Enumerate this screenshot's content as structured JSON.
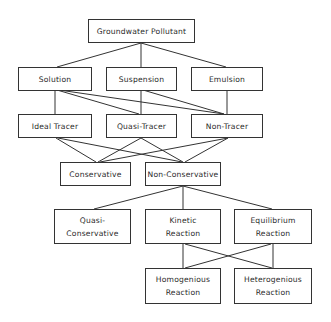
{
  "nodes": {
    "root": {
      "lines": [
        "Groundwater Pollutant"
      ]
    },
    "solution": {
      "lines": [
        "Solution"
      ]
    },
    "suspension": {
      "lines": [
        "Suspension"
      ]
    },
    "emulsion": {
      "lines": [
        "Emulsion"
      ]
    },
    "ideal_tracer": {
      "lines": [
        "Ideal Tracer"
      ]
    },
    "quasi_tracer": {
      "lines": [
        "Quasi-Tracer"
      ]
    },
    "non_tracer": {
      "lines": [
        "Non-Tracer"
      ]
    },
    "conservative": {
      "lines": [
        "Conservative"
      ]
    },
    "non_conservative": {
      "lines": [
        "Non-Conservative"
      ]
    },
    "quasi_conservative": {
      "lines": [
        "Quasi-",
        "Conservative"
      ]
    },
    "kinetic": {
      "lines": [
        "Kinetic",
        "Reaction"
      ]
    },
    "equilibrium": {
      "lines": [
        "Equilibrium",
        "Reaction"
      ]
    },
    "homogenious": {
      "lines": [
        "Homogenious",
        "Reaction"
      ]
    },
    "heterogenious": {
      "lines": [
        "Heterogenious",
        "Reaction"
      ]
    }
  },
  "edges": [
    [
      "root",
      "solution"
    ],
    [
      "root",
      "suspension"
    ],
    [
      "root",
      "emulsion"
    ],
    [
      "solution",
      "ideal_tracer"
    ],
    [
      "solution",
      "quasi_tracer"
    ],
    [
      "solution",
      "non_tracer"
    ],
    [
      "suspension",
      "quasi_tracer"
    ],
    [
      "suspension",
      "non_tracer"
    ],
    [
      "emulsion",
      "non_tracer"
    ],
    [
      "ideal_tracer",
      "conservative"
    ],
    [
      "ideal_tracer",
      "non_conservative"
    ],
    [
      "quasi_tracer",
      "conservative"
    ],
    [
      "quasi_tracer",
      "non_conservative"
    ],
    [
      "non_tracer",
      "conservative"
    ],
    [
      "non_tracer",
      "non_conservative"
    ],
    [
      "non_conservative",
      "quasi_conservative"
    ],
    [
      "non_conservative",
      "kinetic"
    ],
    [
      "non_conservative",
      "equilibrium"
    ],
    [
      "kinetic",
      "homogenious"
    ],
    [
      "kinetic",
      "heterogenious"
    ],
    [
      "equilibrium",
      "homogenious"
    ],
    [
      "equilibrium",
      "heterogenious"
    ]
  ],
  "colors": {
    "line": "#333333",
    "text": "#2a2a2a",
    "background": "#ffffff"
  }
}
